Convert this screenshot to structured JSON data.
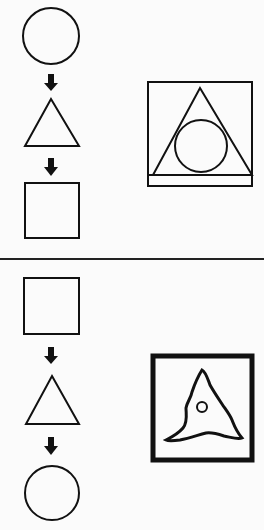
{
  "diagram": {
    "stroke_color": "#111111",
    "background": "#fbfbfb",
    "panels": [
      {
        "sequence": [
          "circle",
          "arrow-down",
          "triangle",
          "arrow-down",
          "square"
        ],
        "answer_figure": "square containing triangle containing inscribed circle"
      },
      {
        "sequence": [
          "square",
          "arrow-down",
          "triangle",
          "arrow-down",
          "circle"
        ],
        "answer_figure": "thick-bordered square containing wavy triangle with small circle"
      }
    ]
  }
}
